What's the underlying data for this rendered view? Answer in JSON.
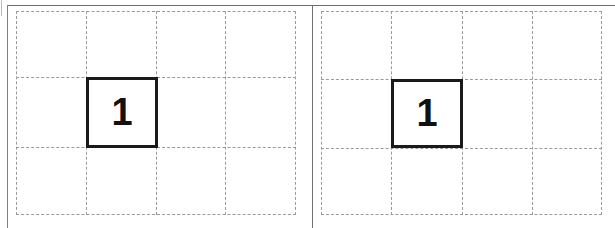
{
  "figure": {
    "type": "grid-diagram",
    "background_color": "#ffffff",
    "grid_line_color": "#9a9a9a",
    "grid_line_style": "dashed",
    "marked_cell_border_color": "#1a1a1a",
    "frame_rule_color": "#707070"
  },
  "panels": [
    {
      "id": "panel-left",
      "name": "left-grid-panel",
      "columns": 4,
      "rows": 3,
      "marked_cells": [
        {
          "label": "1",
          "row": 2,
          "column": 2
        }
      ],
      "column_x": [
        16,
        86,
        156,
        225,
        295
      ],
      "row_y": [
        11,
        77,
        147,
        214
      ]
    },
    {
      "id": "panel-right",
      "name": "right-grid-panel",
      "columns": 4,
      "rows": 3,
      "marked_cells": [
        {
          "label": "1",
          "row": 2,
          "column": 2
        }
      ],
      "column_x": [
        321,
        391,
        462,
        532,
        602
      ],
      "row_y": [
        11,
        79,
        148,
        214
      ]
    }
  ]
}
